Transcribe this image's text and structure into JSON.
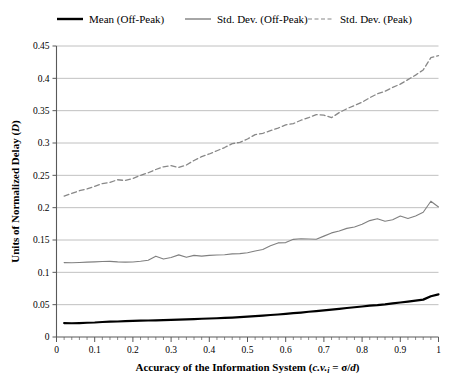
{
  "chart_data": {
    "type": "line",
    "title": "",
    "xlabel": "Accuracy of the Information System (c.v.i = σ/d)",
    "xlabel_parts": {
      "main": "Accuracy of the Information System (",
      "cv": "c.v.",
      "sub": "i",
      "eq": " = ",
      "sigma": "σ",
      "slash": "/",
      "d": "d",
      "close": ")"
    },
    "ylabel": "Units of Normalized Delay (D)",
    "ylabel_parts": {
      "main": "Units of Normalized Delay (",
      "ital": "D",
      "close": ")"
    },
    "xlim": [
      0,
      1
    ],
    "ylim": [
      0,
      0.45
    ],
    "xticks": [
      0,
      0.1,
      0.2,
      0.3,
      0.4,
      0.5,
      0.6,
      0.7,
      0.8,
      0.9,
      1
    ],
    "xtick_labels": [
      "0",
      "0.1",
      "0.2",
      "0.3",
      "0.4",
      "0.5",
      "0.6",
      "0.7",
      "0.8",
      "0.9",
      "1"
    ],
    "yticks": [
      0,
      0.05,
      0.1,
      0.15,
      0.2,
      0.25,
      0.3,
      0.35,
      0.4,
      0.45
    ],
    "ytick_labels": [
      "0",
      "0.05",
      "0.1",
      "0.15",
      "0.2",
      "0.25",
      "0.3",
      "0.35",
      "0.4",
      "0.45"
    ],
    "minor_x_step": 0.02,
    "grid": "horizontal",
    "legend_position": "top",
    "colors": {
      "mean_off_peak": "#000000",
      "std_dev_off_peak": "#808080",
      "std_dev_peak": "#888888",
      "grid": "#b0b0b0",
      "axis": "#595959"
    },
    "x": [
      0.02,
      0.04,
      0.06,
      0.08,
      0.1,
      0.12,
      0.14,
      0.16,
      0.18,
      0.2,
      0.22,
      0.24,
      0.26,
      0.28,
      0.3,
      0.32,
      0.34,
      0.36,
      0.38,
      0.4,
      0.42,
      0.44,
      0.46,
      0.48,
      0.5,
      0.52,
      0.54,
      0.56,
      0.58,
      0.6,
      0.62,
      0.64,
      0.66,
      0.68,
      0.7,
      0.72,
      0.74,
      0.76,
      0.78,
      0.8,
      0.82,
      0.84,
      0.86,
      0.88,
      0.9,
      0.92,
      0.94,
      0.96,
      0.98,
      1.0
    ],
    "series": [
      {
        "name": "Mean (Off-Peak)",
        "key": "mean_off_peak",
        "style": "solid",
        "width": 2.2,
        "color": "#000000",
        "values": [
          0.0215,
          0.0213,
          0.0216,
          0.022,
          0.0224,
          0.0232,
          0.0238,
          0.024,
          0.0244,
          0.0248,
          0.0252,
          0.0255,
          0.0258,
          0.0262,
          0.0266,
          0.0268,
          0.0272,
          0.0276,
          0.0282,
          0.0286,
          0.029,
          0.0296,
          0.03,
          0.0306,
          0.0314,
          0.0322,
          0.0332,
          0.034,
          0.0348,
          0.0358,
          0.0368,
          0.0378,
          0.039,
          0.04,
          0.0412,
          0.0424,
          0.0436,
          0.0448,
          0.046,
          0.0472,
          0.0484,
          0.0492,
          0.0504,
          0.052,
          0.0534,
          0.0548,
          0.0562,
          0.0578,
          0.063,
          0.066
        ]
      },
      {
        "name": "Std. Dev. (Off-Peak)",
        "key": "std_dev_off_peak",
        "style": "solid",
        "width": 1.1,
        "color": "#808080",
        "values": [
          0.115,
          0.1148,
          0.1152,
          0.1158,
          0.1162,
          0.1168,
          0.117,
          0.1162,
          0.1158,
          0.116,
          0.1172,
          0.1188,
          0.125,
          0.1205,
          0.123,
          0.127,
          0.1232,
          0.1262,
          0.125,
          0.1262,
          0.1268,
          0.1272,
          0.1285,
          0.129,
          0.1302,
          0.133,
          0.1352,
          0.141,
          0.1455,
          0.146,
          0.151,
          0.152,
          0.1516,
          0.1512,
          0.156,
          0.161,
          0.164,
          0.168,
          0.17,
          0.1742,
          0.18,
          0.183,
          0.179,
          0.1812,
          0.187,
          0.1832,
          0.1872,
          0.193,
          0.21,
          0.201
        ]
      },
      {
        "name": "Std. Dev. (Peak)",
        "key": "std_dev_peak",
        "style": "dashed",
        "width": 1.3,
        "dash": "5,3",
        "color": "#888888",
        "values": [
          0.218,
          0.222,
          0.2262,
          0.229,
          0.233,
          0.2372,
          0.239,
          0.2432,
          0.242,
          0.2452,
          0.25,
          0.254,
          0.259,
          0.2632,
          0.265,
          0.2622,
          0.266,
          0.273,
          0.279,
          0.283,
          0.288,
          0.293,
          0.299,
          0.301,
          0.3062,
          0.313,
          0.315,
          0.319,
          0.323,
          0.328,
          0.33,
          0.3352,
          0.3392,
          0.344,
          0.343,
          0.3392,
          0.347,
          0.353,
          0.358,
          0.363,
          0.37,
          0.376,
          0.38,
          0.386,
          0.391,
          0.398,
          0.405,
          0.413,
          0.432,
          0.435
        ]
      }
    ]
  },
  "legend": {
    "items": [
      {
        "label": "Mean (Off-Peak)",
        "style": "solid",
        "color": "#000000",
        "width": 2.4
      },
      {
        "label": "Std. Dev. (Off-Peak)",
        "style": "solid",
        "color": "#808080",
        "width": 1.4
      },
      {
        "label": "Std. Dev. (Peak)",
        "style": "dashed",
        "color": "#888888",
        "width": 1.2
      }
    ]
  }
}
